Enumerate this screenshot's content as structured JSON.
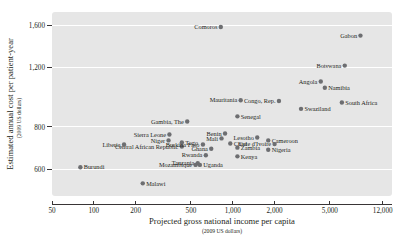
{
  "chart_data": {
    "type": "scatter",
    "title": "",
    "xlabel": "Projected gross national income per capita",
    "xsublabel": "(2009 US dollars)",
    "ylabel": "Estimated annual cost per patient-year",
    "ysublabel": "(2009 US dollars)",
    "xscale": "log",
    "yscale": "log",
    "xlim": [
      50,
      14000
    ],
    "ylim": [
      500,
      1750
    ],
    "xticks": [
      50,
      100,
      200,
      500,
      1000,
      2000,
      5000,
      12000
    ],
    "xticklabels": [
      "50",
      "100",
      "200",
      "500",
      "1,000",
      "2,000",
      "5,000",
      "12,000"
    ],
    "yticks": [
      600,
      800,
      1200,
      1600
    ],
    "yticklabels": [
      "600",
      "800",
      "1,200",
      "1,600"
    ],
    "grid": "horizontal-white",
    "legend": "none",
    "marker_color": "#6d6e71",
    "plot_bg": "#e6e6e6",
    "points": [
      {
        "name": "Comoros",
        "x": 820,
        "y": 1580,
        "side": "right"
      },
      {
        "name": "Gabon",
        "x": 8300,
        "y": 1490,
        "side": "right"
      },
      {
        "name": "Botswana",
        "x": 6400,
        "y": 1215,
        "side": "right"
      },
      {
        "name": "Angola",
        "x": 4300,
        "y": 1090,
        "side": "right"
      },
      {
        "name": "Namibia",
        "x": 4600,
        "y": 1045,
        "side": "left"
      },
      {
        "name": "South Africa",
        "x": 6100,
        "y": 945,
        "side": "left"
      },
      {
        "name": "Mauritania",
        "x": 1140,
        "y": 960,
        "side": "right"
      },
      {
        "name": "Congo, Rep.",
        "x": 2150,
        "y": 955,
        "side": "right"
      },
      {
        "name": "Swaziland",
        "x": 3100,
        "y": 905,
        "side": "left"
      },
      {
        "name": "Senegal",
        "x": 1080,
        "y": 860,
        "side": "left"
      },
      {
        "name": "Gambia, The",
        "x": 470,
        "y": 830,
        "side": "right"
      },
      {
        "name": "Sierra Leone",
        "x": 350,
        "y": 760,
        "side": "right"
      },
      {
        "name": "Niger",
        "x": 345,
        "y": 730,
        "side": "right"
      },
      {
        "name": "Togo",
        "x": 430,
        "y": 720,
        "side": "left"
      },
      {
        "name": "Central African Republic",
        "x": 430,
        "y": 700,
        "side": "right"
      },
      {
        "name": "Liberia",
        "x": 165,
        "y": 710,
        "side": "right"
      },
      {
        "name": "Burundi",
        "x": 80,
        "y": 608,
        "side": "left"
      },
      {
        "name": "Malawi",
        "x": 225,
        "y": 545,
        "side": "left"
      },
      {
        "name": "Benin",
        "x": 880,
        "y": 765,
        "side": "right"
      },
      {
        "name": "Mali",
        "x": 830,
        "y": 740,
        "side": "right"
      },
      {
        "name": "Burkina Faso",
        "x": 610,
        "y": 710,
        "side": "right"
      },
      {
        "name": "Ghana",
        "x": 700,
        "y": 690,
        "side": "right"
      },
      {
        "name": "Chad",
        "x": 960,
        "y": 715,
        "side": "left"
      },
      {
        "name": "Zambia",
        "x": 1080,
        "y": 695,
        "side": "left"
      },
      {
        "name": "Lesotho",
        "x": 1500,
        "y": 745,
        "side": "right"
      },
      {
        "name": "Cameroon",
        "x": 1800,
        "y": 730,
        "side": "left"
      },
      {
        "name": "Cote d'Ivoire",
        "x": 2000,
        "y": 712,
        "side": "right"
      },
      {
        "name": "Nigeria",
        "x": 1800,
        "y": 685,
        "side": "left"
      },
      {
        "name": "Rwanda",
        "x": 640,
        "y": 660,
        "side": "right"
      },
      {
        "name": "Kenya",
        "x": 1080,
        "y": 655,
        "side": "left"
      },
      {
        "name": "Tanzania",
        "x": 560,
        "y": 625,
        "side": "right"
      },
      {
        "name": "Mozambique",
        "x": 540,
        "y": 618,
        "side": "right"
      },
      {
        "name": "Uganda",
        "x": 580,
        "y": 618,
        "side": "left"
      }
    ]
  }
}
